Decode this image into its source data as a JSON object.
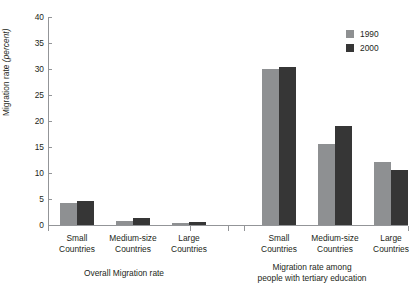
{
  "chart_data": {
    "type": "bar",
    "title": "",
    "xlabel": "",
    "ylabel": "Migration rate (percent)",
    "ylabel_main": "Migration rate ",
    "ylabel_unit": "(percent)",
    "ylim": [
      0,
      40
    ],
    "ytick_step": 5,
    "yticks": [
      0,
      5,
      10,
      15,
      20,
      25,
      30,
      35,
      40
    ],
    "ytick_labels": [
      "0",
      "5",
      "10",
      "15",
      "20",
      "25",
      "30",
      "35",
      "40"
    ],
    "grid": false,
    "legend_position": "top-right",
    "categories": [
      "Small Countries",
      "Medium-size Countries",
      "Large Countries"
    ],
    "series": [
      {
        "name": "1990",
        "color": "#8e9092"
      },
      {
        "name": "2000",
        "color": "#363636"
      }
    ],
    "panels": [
      {
        "caption": "Overall Migration rate",
        "caption_lines": [
          "Overall Migration rate"
        ],
        "groups": [
          {
            "category_line1": "Small",
            "category_line2": "Countries",
            "values": {
              "1990": 4.3,
              "2000": 4.6
            }
          },
          {
            "category_line1": "Medium-size",
            "category_line2": "Countries",
            "values": {
              "1990": 0.8,
              "2000": 1.3
            }
          },
          {
            "category_line1": "Large",
            "category_line2": "Countries",
            "values": {
              "1990": 0.3,
              "2000": 0.6
            }
          }
        ]
      },
      {
        "caption": "Migration rate among people with tertiary education",
        "caption_lines": [
          "Migration rate among",
          "people with tertiary education"
        ],
        "groups": [
          {
            "category_line1": "Small",
            "category_line2": "Countries",
            "values": {
              "1990": 30.0,
              "2000": 30.4
            }
          },
          {
            "category_line1": "Medium-size",
            "category_line2": "Countries",
            "values": {
              "1990": 15.6,
              "2000": 19.0
            }
          },
          {
            "category_line1": "Large",
            "category_line2": "Countries",
            "values": {
              "1990": 12.1,
              "2000": 10.5
            }
          }
        ]
      }
    ]
  },
  "legend": {
    "items": [
      {
        "label": "1990",
        "color": "#8e9092"
      },
      {
        "label": "2000",
        "color": "#363636"
      }
    ]
  }
}
